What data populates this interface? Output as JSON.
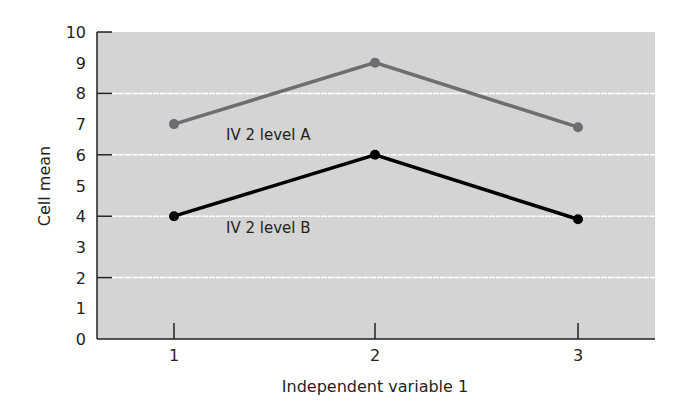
{
  "chart_data": {
    "type": "line",
    "title": "",
    "xlabel": "Independent variable 1",
    "ylabel": "Cell mean",
    "categories": [
      "1",
      "2",
      "3"
    ],
    "x": [
      1,
      2,
      3
    ],
    "series": [
      {
        "name": "IV 2 level A",
        "values": [
          7,
          9,
          6.9
        ],
        "color": "#6d6e71"
      },
      {
        "name": "IV 2 level B",
        "values": [
          4,
          6,
          3.9
        ],
        "color": "#000000"
      }
    ],
    "ylim": [
      0,
      10
    ],
    "yticks": [
      "0",
      "1",
      "2",
      "3",
      "4",
      "5",
      "6",
      "7",
      "8",
      "9",
      "10"
    ],
    "grid": true,
    "grid_values": [
      2,
      4,
      6,
      8
    ],
    "legend": "inline labels",
    "background": "#d9d9d9"
  }
}
